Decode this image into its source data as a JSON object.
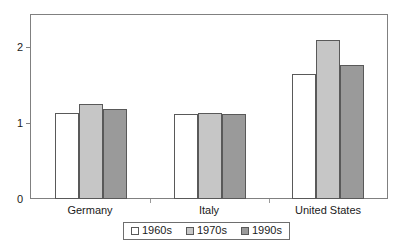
{
  "chart_data": {
    "type": "bar",
    "title": "",
    "subtitle": "",
    "xlabel": "",
    "ylabel": "",
    "categories": [
      "Germany",
      "Italy",
      "United States"
    ],
    "series": [
      {
        "name": "1960s",
        "values": [
          1.13,
          1.12,
          1.65
        ],
        "color": "#ffffff"
      },
      {
        "name": "1970s",
        "values": [
          1.25,
          1.13,
          2.1
        ],
        "color": "#c6c6c6"
      },
      {
        "name": "1990s",
        "values": [
          1.19,
          1.12,
          1.77
        ],
        "color": "#9a9a9a"
      }
    ],
    "ylim": [
      0,
      2.43
    ],
    "yticks": [
      0,
      1,
      2
    ],
    "ytick_labels": [
      "0",
      "1",
      "2"
    ],
    "grid": false,
    "legend_position": "bottom",
    "frame": true,
    "bar_edge_color": "#595959",
    "axis_color": "#808080"
  },
  "axis": {
    "y_labels": [
      "2",
      "1",
      "0"
    ]
  },
  "categories": {
    "c0": "Germany",
    "c1": "Italy",
    "c2": "United States"
  },
  "legend": {
    "items": [
      {
        "label": "1960s"
      },
      {
        "label": "1970s"
      },
      {
        "label": "1990s"
      }
    ]
  }
}
